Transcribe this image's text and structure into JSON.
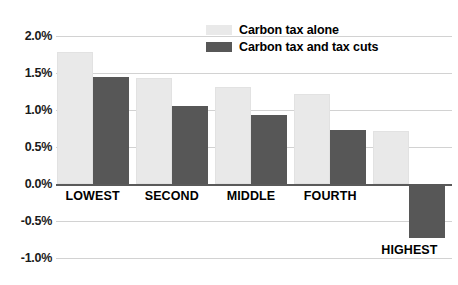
{
  "chart_data": {
    "type": "bar",
    "title": "",
    "subtitle": "",
    "xlabel": "",
    "ylabel": "",
    "categories": [
      "LOWEST",
      "SECOND",
      "MIDDLE",
      "FOURTH",
      "HIGHEST"
    ],
    "series": [
      {
        "name": "Carbon tax alone",
        "color": "#e9e9e9",
        "values": [
          1.78,
          1.43,
          1.31,
          1.21,
          0.72
        ]
      },
      {
        "name": "Carbon tax and tax cuts",
        "color": "#575757",
        "values": [
          1.44,
          1.06,
          0.93,
          0.73,
          -0.73
        ]
      }
    ],
    "ylim": [
      -1.0,
      2.0
    ],
    "ytick_values": [
      2.0,
      1.5,
      1.0,
      0.5,
      0.0,
      -0.5,
      -1.0
    ],
    "ytick_labels": [
      "2.0%",
      "1.5%",
      "1.0%",
      "0.5%",
      "0.0%",
      "-0.5%",
      "-1.0%"
    ],
    "value_unit": "%",
    "grid": true,
    "grid_axis": "y",
    "zero_line": true,
    "legend_position": "top-center"
  },
  "legend": {
    "entries": [
      {
        "label": "Carbon tax alone",
        "swatch": "light"
      },
      {
        "label": "Carbon tax and tax cuts",
        "swatch": "dark"
      }
    ]
  },
  "axis": {
    "y_labels": [
      "2.0%",
      "1.5%",
      "1.0%",
      "0.5%",
      "0.0%",
      "-0.5%",
      "-1.0%"
    ],
    "x_labels": [
      "LOWEST",
      "SECOND",
      "MIDDLE",
      "FOURTH",
      "HIGHEST"
    ]
  },
  "colors": {
    "series_light": "#e9e9e9",
    "series_dark": "#575757",
    "gridline": "#d2d2d2",
    "zero_line": "#5a5a5a",
    "text": "#000000",
    "background": "#ffffff"
  }
}
